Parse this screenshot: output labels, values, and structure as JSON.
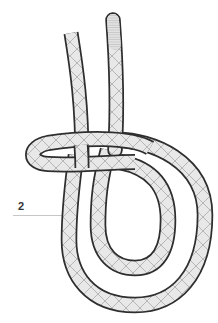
{
  "diagram": {
    "type": "knot-illustration",
    "labels": [
      {
        "id": "2",
        "text": "2"
      }
    ],
    "colors": {
      "outline": "#2e2e2e",
      "rope_fill": "#e6e6e6",
      "rope_shade": "#d4d4d4",
      "crosshatch": "#9a9a9a",
      "leader_line": "#b0b0b0",
      "label_text": "#333333",
      "background": "#ffffff"
    }
  }
}
